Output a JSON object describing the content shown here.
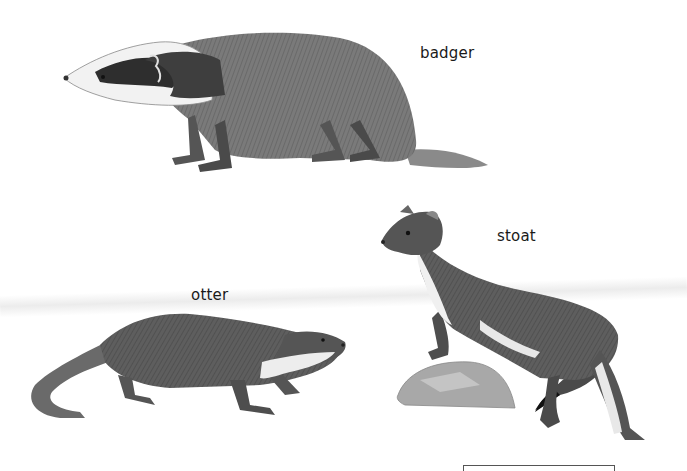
{
  "labels": {
    "badger": "badger",
    "stoat": "stoat",
    "otter": "otter"
  },
  "colors": {
    "background": "#ffffff",
    "fur_dark": "#4a4a4a",
    "fur_mid": "#6e6e6e",
    "fur_light": "#e8e8e8",
    "rock": "#9a9a9a"
  }
}
